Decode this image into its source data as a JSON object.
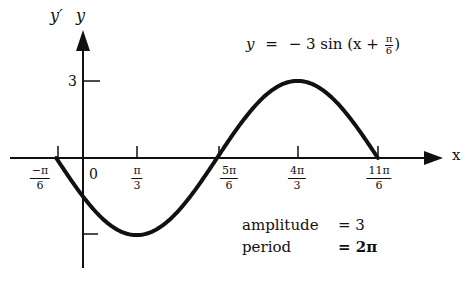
{
  "axes": {
    "y_label_prime": "y′",
    "y_label": "y",
    "x_label": "x",
    "y_tick_label": "3",
    "origin_label": "0"
  },
  "x_ticks": [
    {
      "num": "−π",
      "den": "6"
    },
    {
      "num": "π",
      "den": "3"
    },
    {
      "num": "5π",
      "den": "6"
    },
    {
      "num": "4π",
      "den": "3"
    },
    {
      "num": "11π",
      "den": "6"
    }
  ],
  "equation": {
    "lhs": "y",
    "eq": "=",
    "rhs_prefix": "− 3 sin (x +",
    "frac_num": "π",
    "frac_den": "6",
    "rhs_suffix": ")"
  },
  "info": {
    "amplitude_label": "amplitude",
    "amplitude_value": "= 3",
    "period_label": "period",
    "period_value": "= 2π"
  },
  "colors": {
    "ink": "#111111",
    "background": "#ffffff"
  },
  "chart_data": {
    "type": "line",
    "function": "-3*sin(x + pi/6)",
    "xlabel": "x",
    "ylabel": "y",
    "x_range": [
      -0.5236,
      5.7596
    ],
    "y_range": [
      -3,
      3
    ],
    "x_tick_labels": [
      "−π/6",
      "0",
      "π/3",
      "5π/6",
      "4π/3",
      "11π/6"
    ],
    "y_tick_labels": [
      "3",
      "-3"
    ],
    "key_points": [
      {
        "x": "−π/6",
        "y": 0
      },
      {
        "x": "π/3",
        "y": -3
      },
      {
        "x": "5π/6",
        "y": 0
      },
      {
        "x": "4π/3",
        "y": 3
      },
      {
        "x": "11π/6",
        "y": 0
      }
    ],
    "annotations": [
      "amplitude = 3",
      "period = 2π"
    ],
    "grid": false
  }
}
